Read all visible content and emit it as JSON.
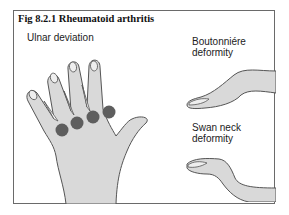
{
  "figure": {
    "title": "Fig 8.2.1 Rheumatoid arthritis",
    "labels": {
      "ulnar": "Ulnar deviation",
      "boutonniere_line1": "Boutonniére",
      "boutonniere_line2": "deformity",
      "swan_line1": "Swan neck",
      "swan_line2": "deformity"
    },
    "colors": {
      "skin": "#d9d9d9",
      "outline": "#555555",
      "joint_marker": "#5e5e5e",
      "border": "#6a6a6a"
    },
    "illustrations": [
      "hand-ulnar-deviation",
      "finger-boutonniere",
      "finger-swan-neck"
    ],
    "joint_markers_count": 4
  }
}
